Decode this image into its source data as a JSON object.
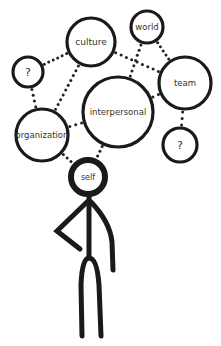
{
  "diagram": {
    "colors": {
      "stroke": "#1a1a1a",
      "dots": "#222222",
      "label": "#333333",
      "background": "#ffffff"
    },
    "nodes": [
      {
        "id": "culture",
        "label": "culture",
        "cx": 91,
        "cy": 42,
        "r": 24,
        "font": 9
      },
      {
        "id": "world",
        "label": "world",
        "cx": 147,
        "cy": 27,
        "r": 16,
        "font": 8.5
      },
      {
        "id": "question-top-left",
        "label": "?",
        "cx": 28,
        "cy": 72,
        "r": 15,
        "font": 11
      },
      {
        "id": "team",
        "label": "team",
        "cx": 185,
        "cy": 83,
        "r": 26,
        "font": 8.5
      },
      {
        "id": "interpersonal",
        "label": "interpersonal",
        "cx": 118,
        "cy": 112,
        "r": 35,
        "font": 8.5
      },
      {
        "id": "organization",
        "label": "organization",
        "cx": 42,
        "cy": 135,
        "r": 26,
        "font": 8.5
      },
      {
        "id": "question-bottom-right",
        "label": "?",
        "cx": 180,
        "cy": 145,
        "r": 17,
        "font": 11
      }
    ],
    "self": {
      "label": "self",
      "cx": 88,
      "cy": 177,
      "r": 17,
      "font": 8
    },
    "connections": [
      {
        "from": "culture",
        "to": "question-top-left"
      },
      {
        "from": "culture",
        "to": "organization"
      },
      {
        "from": "culture",
        "to": "team"
      },
      {
        "from": "world",
        "to": "interpersonal"
      },
      {
        "from": "world",
        "to": "team"
      },
      {
        "from": "question-top-left",
        "to": "organization"
      },
      {
        "from": "organization",
        "to": "interpersonal"
      },
      {
        "from": "interpersonal",
        "to": "team"
      },
      {
        "from": "team",
        "to": "question-bottom-right"
      },
      {
        "from": "organization",
        "to": "self"
      },
      {
        "from": "interpersonal",
        "to": "self"
      }
    ]
  }
}
